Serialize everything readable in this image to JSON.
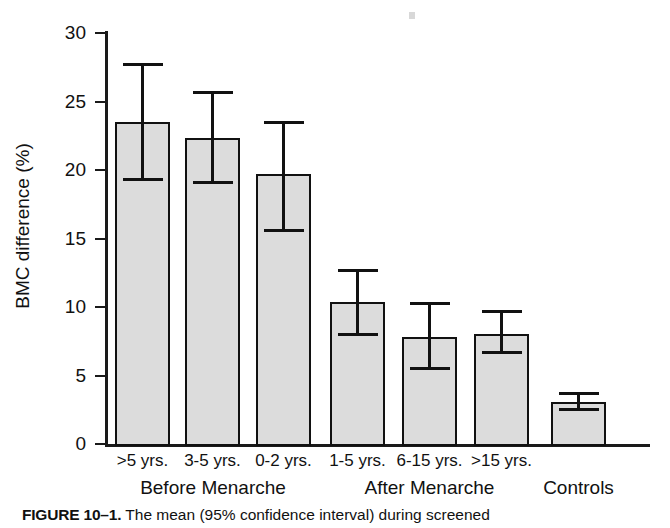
{
  "figure": {
    "caption_prefix": "FIGURE 10–1.",
    "caption_text": "The mean (95% confidence interval) during screened"
  },
  "chart_data": {
    "type": "bar",
    "title": "",
    "xlabel": "",
    "ylabel": "BMC difference (%)",
    "ylim": [
      0,
      30
    ],
    "yticks": [
      0,
      5,
      10,
      15,
      20,
      25,
      30
    ],
    "ytick_labels": [
      "0",
      "5",
      "10",
      "15",
      "20",
      "25",
      "30"
    ],
    "grid": false,
    "legend": "none",
    "categories": [
      ">5 yrs.",
      "3-5 yrs.",
      "0-2 yrs.",
      "1-5 yrs.",
      "6-15 yrs.",
      ">15 yrs.",
      ""
    ],
    "values": [
      23.5,
      22.3,
      19.7,
      10.4,
      7.8,
      8.0,
      3.1
    ],
    "error_upper": [
      27.8,
      25.8,
      23.6,
      12.8,
      10.4,
      9.8,
      3.8
    ],
    "error_lower": [
      19.2,
      19.0,
      15.5,
      7.9,
      5.4,
      6.6,
      2.4
    ],
    "error_type": "95% confidence interval",
    "groups": [
      {
        "label": "Before Menarche",
        "categories": [
          ">5 yrs.",
          "3-5 yrs.",
          "0-2 yrs."
        ]
      },
      {
        "label": "After Menarche",
        "categories": [
          "1-5 yrs.",
          "6-15 yrs.",
          ">15 yrs."
        ]
      },
      {
        "label": "Controls",
        "categories": [
          ""
        ]
      }
    ],
    "bar_fill_color": "#dcdcdc",
    "bar_edge_color": "#111111",
    "axis_color": "#1a1a1a"
  }
}
